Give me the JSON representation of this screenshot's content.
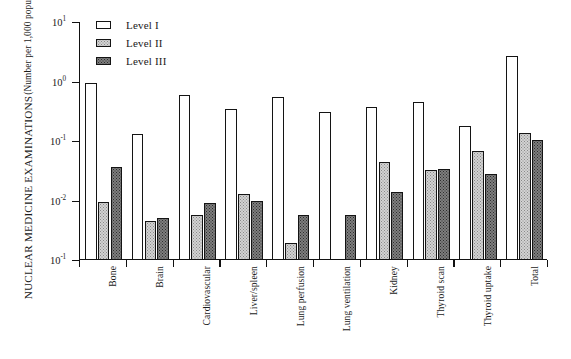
{
  "chart_data": {
    "type": "bar",
    "title": "",
    "ylabel_line1": "NUCLEAR MEDICINE EXAMINATIONS",
    "ylabel_line2": "(Number per 1,000 population)",
    "xlabel": "",
    "scale": "log",
    "grid": false,
    "legend_position": "top-left",
    "ytick_labels": [
      "10",
      "10",
      "10",
      "10",
      "10"
    ],
    "ytick_exponents": [
      "1",
      "0",
      "-1",
      "-2",
      "-1"
    ],
    "ytick_values": [
      10,
      1,
      0.1,
      0.01,
      0.001
    ],
    "ylim": [
      0.001,
      10
    ],
    "categories": [
      "Bone",
      "Brain",
      "Cardiovascular",
      "Liver/spleen",
      "Lung perfusion",
      "Lung ventilation",
      "Kidney",
      "Thyroid scan",
      "Thyroid uptake",
      "Total"
    ],
    "series": [
      {
        "name": "Level I",
        "fill": "white",
        "values": [
          0.95,
          0.13,
          0.6,
          0.35,
          0.54,
          0.31,
          0.37,
          0.46,
          0.18,
          2.7
        ]
      },
      {
        "name": "Level II",
        "fill": "light-stipple",
        "values": [
          0.0096,
          0.0045,
          0.0057,
          0.013,
          0.0019,
          null,
          0.044,
          0.033,
          0.068,
          0.135
        ]
      },
      {
        "name": "Level III",
        "fill": "dark-stipple",
        "values": [
          0.037,
          0.005,
          0.009,
          0.01,
          0.0058,
          0.0058,
          0.014,
          0.034,
          0.028,
          0.105
        ]
      }
    ]
  },
  "legend": {
    "items": [
      {
        "label": "Level I"
      },
      {
        "label": "Level II"
      },
      {
        "label": "Level III"
      }
    ]
  },
  "colors": {
    "axis": "#141414",
    "level1": "#ffffff",
    "level2": "#d2d2d2",
    "level3": "#7e7e7e",
    "background": "#ffffff"
  }
}
